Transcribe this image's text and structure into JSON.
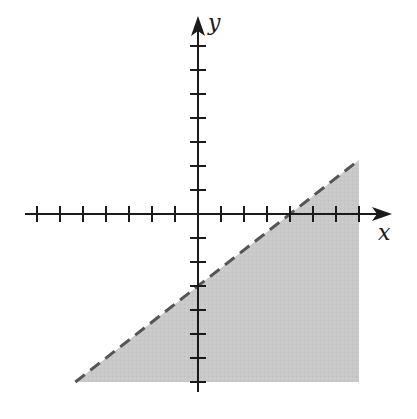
{
  "chart_data": {
    "type": "area",
    "title": "",
    "xlabel": "x",
    "ylabel": "y",
    "xlim": [
      -7,
      7
    ],
    "ylim": [
      -7,
      7
    ],
    "x_ticks": [
      -7,
      -6,
      -5,
      -4,
      -3,
      -2,
      -1,
      1,
      2,
      3,
      4,
      5,
      6,
      7
    ],
    "y_ticks": [
      -7,
      -6,
      -5,
      -4,
      -3,
      -2,
      -1,
      1,
      2,
      3,
      4,
      5,
      6,
      7
    ],
    "tick_labels_shown": false,
    "grid": false,
    "legend": null,
    "boundary_line": {
      "style": "dashed",
      "slope": 0.75,
      "y_intercept": -3,
      "x_intercept": 4,
      "equation": "y = (3/4)x - 3",
      "points": [
        [
          -5.333,
          -7
        ],
        [
          0,
          -3
        ],
        [
          4,
          0
        ],
        [
          7,
          2.25
        ]
      ]
    },
    "shaded_region": {
      "side": "below",
      "inequality": "y < (3/4)x - 3",
      "polygon": [
        [
          -5.333,
          -7
        ],
        [
          7,
          2.25
        ],
        [
          7,
          -7
        ]
      ],
      "color": "#c8c8c8"
    }
  },
  "labels": {
    "x_axis": "x",
    "y_axis": "y"
  },
  "colors": {
    "axis": "#1a1a1a",
    "shade": "#c8c8c8",
    "boundary": "#555555"
  }
}
